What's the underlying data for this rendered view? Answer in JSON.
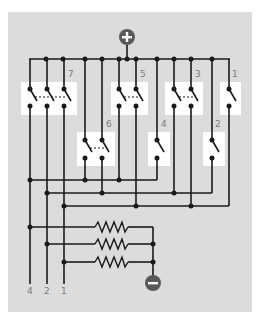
{
  "diagram": {
    "colors": {
      "background": "#dcdcdc",
      "switch_box": "#ffffff",
      "wire": "#1a1a1a",
      "terminal": "#595959",
      "label": "#7a7a7a"
    },
    "terminals": {
      "positive": {
        "symbol": "+",
        "label": "positive-terminal"
      },
      "negative": {
        "symbol": "−",
        "label": "negative-terminal"
      }
    },
    "switch_labels": {
      "s7": "7",
      "s6": "6",
      "s5": "5",
      "s4": "4",
      "s3": "3",
      "s2": "2",
      "s1": "1"
    },
    "output_labels": {
      "out4": "4",
      "out2": "2",
      "out1": "1"
    },
    "switches": [
      {
        "label": "7",
        "poles": 3,
        "outputs": [
          "4",
          "2",
          "1"
        ]
      },
      {
        "label": "6",
        "poles": 2,
        "outputs": [
          "4",
          "2"
        ]
      },
      {
        "label": "5",
        "poles": 2,
        "outputs": [
          "4",
          "1"
        ]
      },
      {
        "label": "4",
        "poles": 1,
        "outputs": [
          "4"
        ]
      },
      {
        "label": "3",
        "poles": 2,
        "outputs": [
          "2",
          "1"
        ]
      },
      {
        "label": "2",
        "poles": 1,
        "outputs": [
          "2"
        ]
      },
      {
        "label": "1",
        "poles": 1,
        "outputs": [
          "1"
        ]
      }
    ],
    "resistor_count": 3
  }
}
